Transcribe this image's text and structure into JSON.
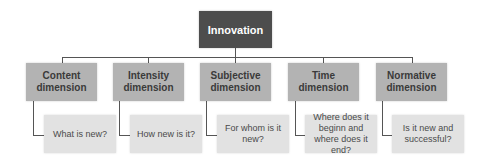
{
  "diagram": {
    "root": {
      "label": "Innovation",
      "color": "#4d4d4d"
    },
    "dimensions": [
      {
        "label": "Content dimension",
        "question": "What is new?"
      },
      {
        "label": "Intensity dimension",
        "question": "How new is it?"
      },
      {
        "label": "Subjective dimension",
        "question": "For whom is it new?"
      },
      {
        "label": "Time dimension",
        "question": "Where does it beginn and where does it end?"
      },
      {
        "label": "Normative dimension",
        "question": "Is it new and successful?"
      }
    ],
    "colors": {
      "dimension_box": "#b3b3b3",
      "question_box": "#e2e2e2",
      "connector": "#555555"
    }
  }
}
